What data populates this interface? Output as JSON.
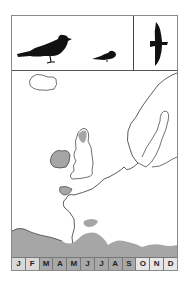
{
  "figure": {
    "type": "field-guide species panel",
    "silhouettes": [
      {
        "name": "large-perched-bird",
        "icon": "bird-perched-large-icon"
      },
      {
        "name": "small-perched-bird",
        "icon": "bird-perched-small-icon"
      },
      {
        "name": "flying-bird",
        "icon": "bird-flight-icon"
      }
    ],
    "map": {
      "region": "North-west Europe",
      "range_fill": "#a6a6a6",
      "coast_stroke": "#333333"
    },
    "months": [
      {
        "label": "J",
        "fill": "#d9d9d9"
      },
      {
        "label": "F",
        "fill": "#d9d9d9"
      },
      {
        "label": "M",
        "fill": "#a8a8a8"
      },
      {
        "label": "A",
        "fill": "#a8a8a8"
      },
      {
        "label": "M",
        "fill": "#a8a8a8"
      },
      {
        "label": "J",
        "fill": "#a8a8a8"
      },
      {
        "label": "J",
        "fill": "#a8a8a8"
      },
      {
        "label": "A",
        "fill": "#a8a8a8"
      },
      {
        "label": "S",
        "fill": "#a8a8a8"
      },
      {
        "label": "O",
        "fill": "#e6e6e6"
      },
      {
        "label": "N",
        "fill": "#e6e6e6"
      },
      {
        "label": "D",
        "fill": "#e6e6e6"
      }
    ]
  }
}
